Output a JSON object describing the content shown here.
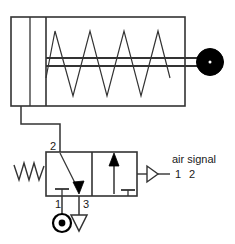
{
  "diagram": {
    "colors": {
      "line": "#333333",
      "fill_solid": "#000000",
      "background": "#ffffff",
      "text": "#1a1a1a"
    },
    "cylinder": {
      "name": "single-acting-spring-return-cylinder",
      "spring_peaks": 4,
      "rod_end": "solid-circle-with-center-dot"
    },
    "valve": {
      "name": "3-2-way-pilot-operated-spring-return-valve",
      "positions": 2,
      "actuator_left": "spring-return",
      "actuator_right": "pilot-air-signal",
      "port_labels": {
        "port_2": "2",
        "port_1": "1",
        "port_3": "3"
      },
      "supply_symbol": "pressure-source-circle",
      "exhaust_symbol": "exhaust-triangle"
    },
    "annotations": {
      "pilot_label_line1": "air  signal",
      "pilot_label_line2_a": "1",
      "pilot_label_line2_b": "2"
    }
  }
}
